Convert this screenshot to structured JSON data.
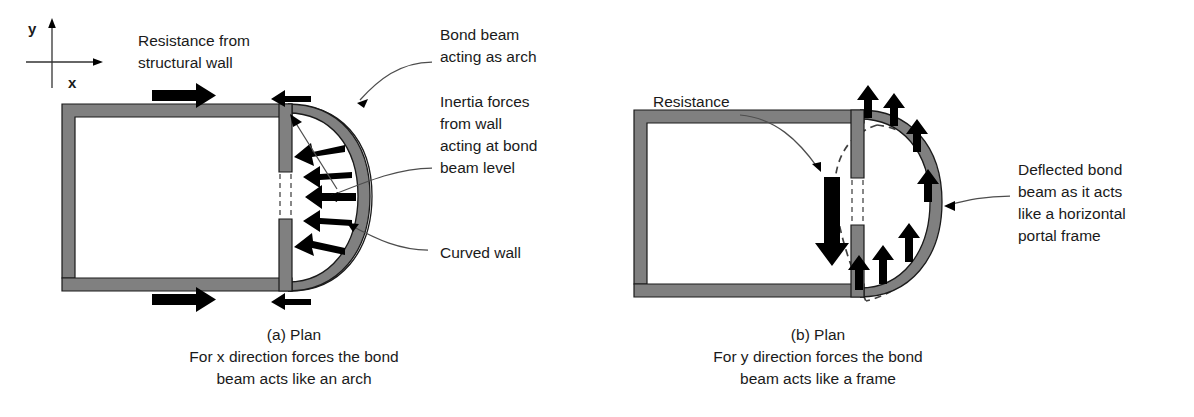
{
  "figure": {
    "background_color": "#ffffff",
    "wall_fill_color": "#808080",
    "arrow_color": "#000000",
    "leader_color": "#4d4d4d"
  },
  "axes": {
    "y_label": "y",
    "x_label": "x",
    "icon_y": "axis-arrow-up-icon",
    "icon_x": "axis-arrow-right-icon"
  },
  "panel_a": {
    "caption_line1": "(a) Plan",
    "caption_line2": "For x direction forces the bond",
    "caption_line3": "beam acts like an arch",
    "labels": {
      "resistance_line1": "Resistance from",
      "resistance_line2": "structural wall",
      "bond_beam_line1": "Bond beam",
      "bond_beam_line2": "acting as arch",
      "inertia_line1": "Inertia forces",
      "inertia_line2": "from wall",
      "inertia_line3": "acting at bond",
      "inertia_line4": "beam level",
      "curved_wall": "Curved wall"
    },
    "arrow_counts": {
      "resistance_arrows": 2,
      "inertia_arrows": 5,
      "reaction_arrows": 2
    }
  },
  "panel_b": {
    "caption_line1": "(b) Plan",
    "caption_line2": "For y direction forces the bond",
    "caption_line3": "beam acts like a frame",
    "labels": {
      "resistance": "Resistance",
      "deflected_line1": "Deflected bond",
      "deflected_line2": "beam as it acts",
      "deflected_line3": "like a horizontal",
      "deflected_line4": "portal frame"
    },
    "arrow_counts": {
      "resistance_arrows": 1,
      "uplift_arrows": 6
    }
  }
}
